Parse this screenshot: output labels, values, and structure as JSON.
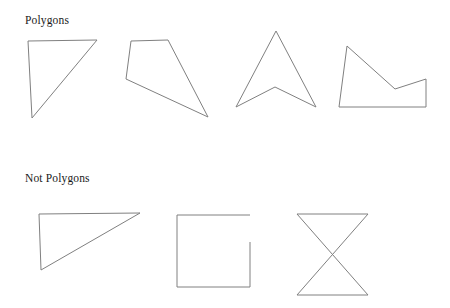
{
  "page": {
    "width": 450,
    "height": 308,
    "background_color": "#ffffff",
    "stroke_color": "#808080",
    "text_color": "#1a1a1a",
    "stroke_width": 1
  },
  "sections": [
    {
      "id": "polygons",
      "label": "Polygons",
      "label_position": {
        "x": 25,
        "y": 14
      }
    },
    {
      "id": "not-polygons",
      "label": "Not Polygons",
      "label_position": {
        "x": 25,
        "y": 172
      }
    }
  ],
  "shapes": [
    {
      "id": "right-triangle",
      "name": "right-triangle",
      "section": "polygons",
      "kind": "closed-polygon",
      "points": "28,41 97,40 32,118"
    },
    {
      "id": "quadrilateral",
      "name": "quadrilateral",
      "section": "polygons",
      "kind": "closed-polygon",
      "points": "131,41 168,40 208,117 126,79"
    },
    {
      "id": "concave-arrow",
      "name": "concave-arrow-polygon",
      "section": "polygons",
      "kind": "closed-polygon",
      "points": "276,31 316,107 275,87 236,107"
    },
    {
      "id": "zigzag-pentagon",
      "name": "zigzag-pentagon",
      "section": "polygons",
      "kind": "closed-polygon",
      "points": "347,46 395,89 426,79 426,107 339,107"
    },
    {
      "id": "self-intersecting-open-figure",
      "name": "self-intersecting-open-figure",
      "section": "not-polygons",
      "kind": "open-polyline",
      "points": "39,214 140,213 41,270 39,214"
    },
    {
      "id": "open-square",
      "name": "open-square-with-gap",
      "section": "not-polygons",
      "kind": "open-polyline",
      "segments": [
        "177,215 250,215",
        "250,242 250,287 177,287 177,215"
      ]
    },
    {
      "id": "bowtie",
      "name": "bowtie-self-intersecting",
      "section": "not-polygons",
      "kind": "open-polyline",
      "points": "297,214 368,214 297,295 368,295 297,214"
    }
  ]
}
